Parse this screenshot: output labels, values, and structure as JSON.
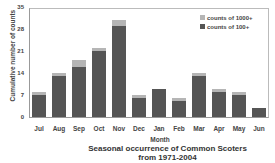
{
  "chart_data": {
    "type": "bar",
    "stacked": true,
    "title_lines": [
      "Seasonal occurrence of Common Scoters",
      "from 1971-2004"
    ],
    "xlabel": "Month",
    "ylabel": "Cumulative number of counts",
    "ylim": [
      0,
      35
    ],
    "yticks": [
      0,
      7,
      14,
      21,
      28,
      35
    ],
    "categories": [
      "Jul",
      "Aug",
      "Sep",
      "Oct",
      "Nov",
      "Dec",
      "Jan",
      "Feb",
      "Mar",
      "Apr",
      "May",
      "Jun"
    ],
    "series": [
      {
        "name": "counts of 100+",
        "color": "#555555",
        "values": [
          7,
          13,
          16,
          21,
          29,
          6,
          9,
          5,
          13,
          8,
          7,
          3
        ]
      },
      {
        "name": "counts of 1000+",
        "color": "#b5b5b5",
        "values": [
          1,
          1,
          2,
          1,
          2,
          1,
          0,
          1,
          1,
          1,
          1,
          0
        ]
      }
    ],
    "legend": [
      "counts of 1000+",
      "counts of 100+"
    ],
    "legend_position": "top-right",
    "grid": false
  }
}
